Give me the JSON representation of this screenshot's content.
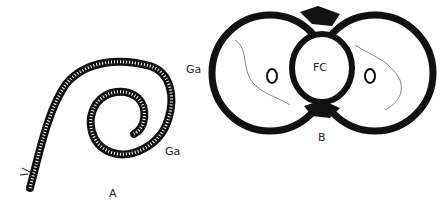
{
  "panels": [
    {
      "id": "A",
      "label": "A",
      "annotations": [
        {
          "text": "Ga"
        }
      ]
    },
    {
      "id": "B",
      "label": "B",
      "annotations": [
        {
          "text": "Ga"
        },
        {
          "text": "FC"
        }
      ]
    }
  ],
  "colors": {
    "ink": "#111111",
    "paper": "#ffffff"
  }
}
